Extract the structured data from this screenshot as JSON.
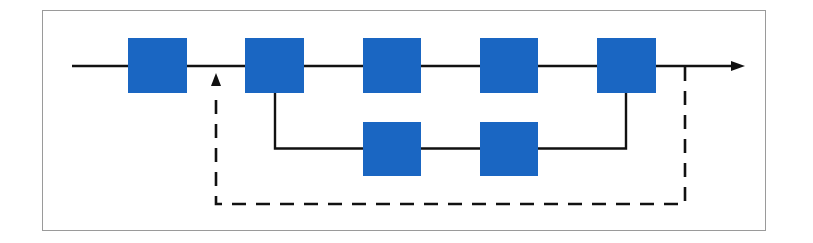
{
  "diagram": {
    "type": "block-flow",
    "colors": {
      "block": "#1a66c2",
      "line": "#111111",
      "frame": "#9a9a9a",
      "background": "#ffffff"
    },
    "main_path_blocks": [
      {
        "id": "b1",
        "x": 128,
        "y": 38,
        "w": 59,
        "h": 55
      },
      {
        "id": "b2",
        "x": 245,
        "y": 38,
        "w": 59,
        "h": 55
      },
      {
        "id": "b3",
        "x": 363,
        "y": 38,
        "w": 58,
        "h": 55
      },
      {
        "id": "b4",
        "x": 480,
        "y": 38,
        "w": 58,
        "h": 55
      },
      {
        "id": "b5",
        "x": 597,
        "y": 38,
        "w": 59,
        "h": 55
      }
    ],
    "branch_path_blocks": [
      {
        "id": "b6",
        "x": 363,
        "y": 122,
        "w": 58,
        "h": 54
      },
      {
        "id": "b7",
        "x": 480,
        "y": 122,
        "w": 58,
        "h": 54
      }
    ],
    "connections": [
      {
        "type": "solid",
        "desc": "main line input to output arrow"
      },
      {
        "type": "solid",
        "desc": "parallel branch from b2 through b6, b7 to b5"
      },
      {
        "type": "dashed",
        "desc": "feedback loop from output back to input of b2",
        "arrow": "up"
      }
    ]
  }
}
